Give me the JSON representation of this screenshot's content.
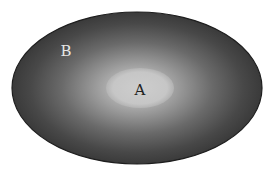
{
  "diagram": {
    "type": "nested-sets",
    "outer_set": {
      "label": "B",
      "label_color": "#e6e6e6",
      "fill_edge_color": "#3a3a3a",
      "fill_center_color": "#bdbdbd",
      "stroke_color": "#1e1e1e"
    },
    "inner_set": {
      "label": "A",
      "label_color": "#222222",
      "fill_color": "#c8c8c8"
    },
    "relationship": "A is a subset of B"
  }
}
